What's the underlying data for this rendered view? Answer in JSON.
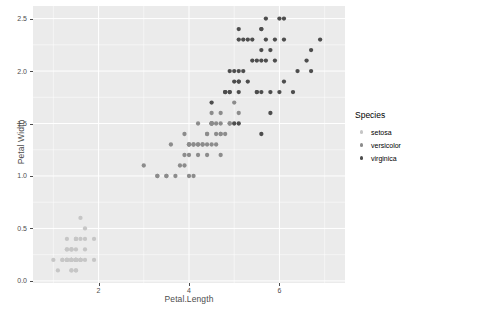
{
  "chart_data": {
    "type": "scatter",
    "title": "",
    "subtitle": "",
    "xlabel": "Petal.Length",
    "ylabel": "Petal.Width",
    "xlim": [
      0.55,
      7.45
    ],
    "ylim": [
      -0.02,
      2.62
    ],
    "xticks": [
      2,
      4,
      6
    ],
    "xtick_labels": [
      "2",
      "4",
      "6"
    ],
    "yticks": [
      0.0,
      0.5,
      1.0,
      1.5,
      2.0,
      2.5
    ],
    "ytick_labels": [
      "0.0",
      "0.5",
      "1.0",
      "1.5",
      "2.0",
      "2.5"
    ],
    "grid": "minor-and-major white gridlines on grey panel",
    "panel_background": "#ebebeb",
    "gridline_color": "#ffffff",
    "legend_position": "right",
    "legend_title": "Species",
    "point_size": 3.2,
    "series": [
      {
        "name": "setosa",
        "color": "#c6c6c6",
        "points": [
          [
            1.4,
            0.2
          ],
          [
            1.4,
            0.2
          ],
          [
            1.3,
            0.2
          ],
          [
            1.5,
            0.2
          ],
          [
            1.4,
            0.2
          ],
          [
            1.7,
            0.4
          ],
          [
            1.4,
            0.3
          ],
          [
            1.5,
            0.2
          ],
          [
            1.4,
            0.2
          ],
          [
            1.5,
            0.1
          ],
          [
            1.5,
            0.2
          ],
          [
            1.6,
            0.2
          ],
          [
            1.4,
            0.1
          ],
          [
            1.1,
            0.1
          ],
          [
            1.2,
            0.2
          ],
          [
            1.5,
            0.4
          ],
          [
            1.3,
            0.4
          ],
          [
            1.4,
            0.3
          ],
          [
            1.7,
            0.3
          ],
          [
            1.5,
            0.3
          ],
          [
            1.7,
            0.2
          ],
          [
            1.5,
            0.4
          ],
          [
            1.0,
            0.2
          ],
          [
            1.7,
            0.5
          ],
          [
            1.9,
            0.2
          ],
          [
            1.6,
            0.2
          ],
          [
            1.6,
            0.4
          ],
          [
            1.5,
            0.2
          ],
          [
            1.4,
            0.2
          ],
          [
            1.6,
            0.2
          ],
          [
            1.6,
            0.2
          ],
          [
            1.5,
            0.4
          ],
          [
            1.5,
            0.1
          ],
          [
            1.4,
            0.2
          ],
          [
            1.5,
            0.2
          ],
          [
            1.2,
            0.2
          ],
          [
            1.3,
            0.2
          ],
          [
            1.4,
            0.1
          ],
          [
            1.3,
            0.2
          ],
          [
            1.5,
            0.2
          ],
          [
            1.3,
            0.3
          ],
          [
            1.3,
            0.3
          ],
          [
            1.3,
            0.2
          ],
          [
            1.6,
            0.6
          ],
          [
            1.9,
            0.4
          ],
          [
            1.4,
            0.3
          ],
          [
            1.6,
            0.2
          ],
          [
            1.4,
            0.2
          ],
          [
            1.5,
            0.2
          ],
          [
            1.4,
            0.2
          ]
        ]
      },
      {
        "name": "versicolor",
        "color": "#8c8c8c",
        "points": [
          [
            4.7,
            1.4
          ],
          [
            4.5,
            1.5
          ],
          [
            4.9,
            1.5
          ],
          [
            4.0,
            1.3
          ],
          [
            4.6,
            1.5
          ],
          [
            4.5,
            1.3
          ],
          [
            4.7,
            1.6
          ],
          [
            3.3,
            1.0
          ],
          [
            4.6,
            1.3
          ],
          [
            3.9,
            1.4
          ],
          [
            3.5,
            1.0
          ],
          [
            4.2,
            1.5
          ],
          [
            4.0,
            1.0
          ],
          [
            4.7,
            1.4
          ],
          [
            3.6,
            1.3
          ],
          [
            4.4,
            1.4
          ],
          [
            4.5,
            1.5
          ],
          [
            4.1,
            1.0
          ],
          [
            4.5,
            1.5
          ],
          [
            3.9,
            1.1
          ],
          [
            4.8,
            1.8
          ],
          [
            4.0,
            1.3
          ],
          [
            4.9,
            1.5
          ],
          [
            4.7,
            1.2
          ],
          [
            4.3,
            1.3
          ],
          [
            4.4,
            1.4
          ],
          [
            4.8,
            1.4
          ],
          [
            5.0,
            1.7
          ],
          [
            4.5,
            1.5
          ],
          [
            3.5,
            1.0
          ],
          [
            3.8,
            1.1
          ],
          [
            3.7,
            1.0
          ],
          [
            3.9,
            1.2
          ],
          [
            5.1,
            1.6
          ],
          [
            4.5,
            1.5
          ],
          [
            4.5,
            1.6
          ],
          [
            4.7,
            1.5
          ],
          [
            4.4,
            1.3
          ],
          [
            4.1,
            1.3
          ],
          [
            4.0,
            1.3
          ],
          [
            4.4,
            1.2
          ],
          [
            4.6,
            1.4
          ],
          [
            4.0,
            1.2
          ],
          [
            3.3,
            1.0
          ],
          [
            4.2,
            1.3
          ],
          [
            4.2,
            1.2
          ],
          [
            4.2,
            1.3
          ],
          [
            4.3,
            1.3
          ],
          [
            3.0,
            1.1
          ],
          [
            4.1,
            1.3
          ]
        ]
      },
      {
        "name": "virginica",
        "color": "#4d4d4d",
        "points": [
          [
            6.0,
            2.5
          ],
          [
            5.1,
            1.9
          ],
          [
            5.9,
            2.1
          ],
          [
            5.6,
            1.8
          ],
          [
            5.8,
            2.2
          ],
          [
            6.6,
            2.1
          ],
          [
            4.5,
            1.7
          ],
          [
            6.3,
            1.8
          ],
          [
            5.8,
            1.8
          ],
          [
            6.1,
            2.5
          ],
          [
            5.1,
            2.0
          ],
          [
            5.3,
            1.9
          ],
          [
            5.5,
            2.1
          ],
          [
            5.0,
            2.0
          ],
          [
            5.1,
            2.4
          ],
          [
            5.3,
            2.3
          ],
          [
            5.5,
            1.8
          ],
          [
            6.7,
            2.2
          ],
          [
            6.9,
            2.3
          ],
          [
            5.0,
            1.5
          ],
          [
            5.7,
            2.3
          ],
          [
            4.9,
            2.0
          ],
          [
            6.7,
            2.0
          ],
          [
            4.9,
            1.8
          ],
          [
            5.7,
            2.1
          ],
          [
            6.0,
            1.8
          ],
          [
            4.8,
            1.8
          ],
          [
            4.9,
            1.8
          ],
          [
            5.6,
            2.1
          ],
          [
            5.8,
            1.6
          ],
          [
            6.1,
            1.9
          ],
          [
            6.4,
            2.0
          ],
          [
            5.6,
            2.2
          ],
          [
            5.1,
            1.5
          ],
          [
            5.6,
            1.4
          ],
          [
            6.1,
            2.3
          ],
          [
            5.6,
            2.4
          ],
          [
            5.5,
            1.8
          ],
          [
            4.8,
            1.8
          ],
          [
            5.4,
            2.1
          ],
          [
            5.6,
            2.4
          ],
          [
            5.1,
            2.3
          ],
          [
            5.1,
            1.9
          ],
          [
            5.9,
            2.3
          ],
          [
            5.7,
            2.5
          ],
          [
            5.2,
            2.3
          ],
          [
            5.0,
            1.9
          ],
          [
            5.2,
            2.0
          ],
          [
            5.4,
            2.3
          ],
          [
            5.1,
            1.8
          ]
        ]
      }
    ]
  },
  "axes": {
    "x_title": "Petal.Length",
    "y_title": "Petal Width"
  },
  "legend": {
    "title": "Species",
    "items": [
      {
        "label": "setosa",
        "color": "#c6c6c6"
      },
      {
        "label": "versicolor",
        "color": "#8c8c8c"
      },
      {
        "label": "virginica",
        "color": "#4d4d4d"
      }
    ]
  }
}
